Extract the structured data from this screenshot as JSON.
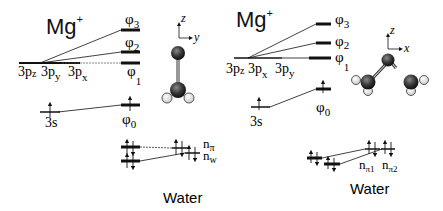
{
  "left_panel": {
    "ion_label": "Mg",
    "ion_charge": "+",
    "p_orbitals": [
      {
        "main": "3p",
        "sub": "z"
      },
      {
        "main": "3p",
        "sub": "y"
      },
      {
        "main": "3p",
        "sub": "x"
      }
    ],
    "s_orbital": "3s",
    "mo_levels": [
      {
        "main": "φ",
        "sub": "3"
      },
      {
        "main": "φ",
        "sub": "2"
      },
      {
        "main": "φ",
        "sub": "1"
      },
      {
        "main": "φ",
        "sub": "0"
      }
    ],
    "water_levels": [
      {
        "main": "n",
        "sub": "π"
      },
      {
        "main": "n",
        "sub": "w"
      }
    ],
    "water_label": "Water",
    "axes": {
      "vertical": "z",
      "horizontal": "y"
    }
  },
  "right_panel": {
    "ion_label": "Mg",
    "ion_charge": "+",
    "p_orbitals": [
      {
        "main": "3p",
        "sub": "z"
      },
      {
        "main": "3p",
        "sub": "x"
      },
      {
        "main": "3p",
        "sub": "y"
      }
    ],
    "s_orbital": "3s",
    "mo_levels": [
      {
        "main": "φ",
        "sub": "3"
      },
      {
        "main": "φ",
        "sub": "2"
      },
      {
        "main": "φ",
        "sub": "1"
      },
      {
        "main": "φ",
        "sub": "0"
      }
    ],
    "water_levels": [
      {
        "main": "n",
        "sub": "π1"
      },
      {
        "main": "n",
        "sub": "π2"
      }
    ],
    "water_label": "Water",
    "axes": {
      "vertical": "z",
      "horizontal": "x"
    }
  }
}
